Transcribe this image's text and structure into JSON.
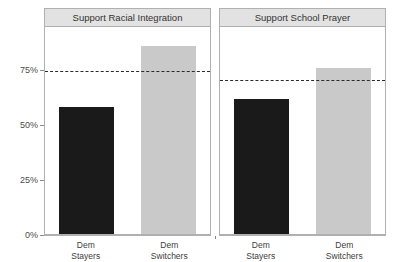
{
  "chart_data": {
    "type": "bar",
    "title": "",
    "xlabel": "",
    "ylabel": "",
    "ylim": [
      0,
      95
    ],
    "grid": false,
    "legend": "none",
    "y_ticks": [
      {
        "value": 0,
        "label": "0%"
      },
      {
        "value": 25,
        "label": "25%"
      },
      {
        "value": 50,
        "label": "50%"
      },
      {
        "value": 75,
        "label": "75%"
      }
    ],
    "categories": [
      "Dem Stayers",
      "Dem Switchers"
    ],
    "category_lines": [
      [
        "Dem",
        "Stayers"
      ],
      [
        "Dem",
        "Switchers"
      ]
    ],
    "panels": [
      {
        "title": "Support Racial Integration",
        "values": [
          58,
          86
        ],
        "reference_line": 75,
        "bars": [
          {
            "category": "Dem Stayers",
            "value": 58,
            "color": "#1a1a1a"
          },
          {
            "category": "Dem Switchers",
            "value": 86,
            "color": "#c9c9c9"
          }
        ]
      },
      {
        "title": "Support School Prayer",
        "values": [
          62,
          76
        ],
        "reference_line": 71,
        "bars": [
          {
            "category": "Dem Stayers",
            "value": 62,
            "color": "#1a1a1a"
          },
          {
            "category": "Dem Switchers",
            "value": 76,
            "color": "#c9c9c9"
          }
        ]
      }
    ],
    "colors": {
      "bar_dark": "#1a1a1a",
      "bar_light": "#c9c9c9",
      "panel_strip": "#e2e2e2",
      "panel_border": "#b0b0b0",
      "refline": "#2b2b2b",
      "tick_text": "#4d4d4d"
    }
  }
}
